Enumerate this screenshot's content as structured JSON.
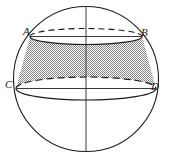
{
  "figure": {
    "kind": "geometry-diagram",
    "background_color": "#ffffff",
    "stroke_color": "#1a1a1a",
    "shade_color": "#9a9a9a",
    "labels": [
      {
        "id": "A",
        "text": "A",
        "x": 23,
        "y": 26
      },
      {
        "id": "B",
        "text": "B",
        "x": 141,
        "y": 27
      },
      {
        "id": "C",
        "text": "C",
        "x": 5,
        "y": 79
      },
      {
        "id": "D",
        "text": "D",
        "x": 151,
        "y": 81
      }
    ],
    "geometry": {
      "sphere": {
        "cx": 86,
        "cy": 79,
        "r": 72.5
      },
      "axis": {
        "x": 86,
        "y1": 6.5,
        "y2": 151.5
      },
      "upper_circle": {
        "cx": 86,
        "cy": 36.5,
        "rx": 56,
        "ry": 8,
        "chord_x1": 30,
        "chord_x2": 142,
        "front": "solid",
        "back": "dashed"
      },
      "lower_circle": {
        "cx": 86,
        "cy": 88.5,
        "rx": 70,
        "ry": 11.5,
        "chord_x1": 16,
        "chord_x2": 156,
        "front": "solid",
        "back": "dashed"
      }
    }
  }
}
